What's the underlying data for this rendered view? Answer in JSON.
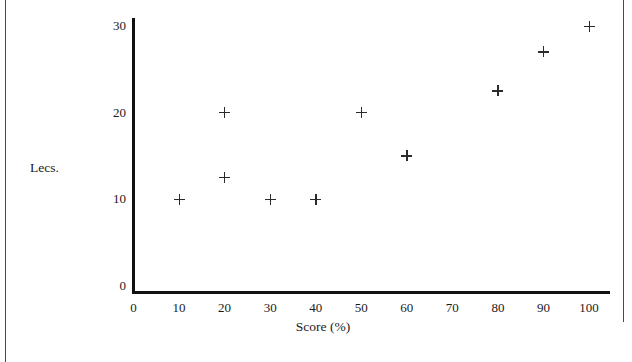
{
  "chart_data": {
    "type": "scatter",
    "title": "",
    "xlabel": "Score (%)",
    "ylabel": "Lecs.",
    "xlim": [
      0,
      100
    ],
    "ylim": [
      0,
      30
    ],
    "grid": false,
    "legend": false,
    "marker": "plus",
    "marker_color": "#2b2b2b",
    "xticks": [
      0,
      10,
      20,
      30,
      40,
      50,
      60,
      70,
      80,
      90,
      100
    ],
    "xtick_labels": [
      "0",
      "10",
      "20",
      "30",
      "40",
      "50",
      "60",
      "70",
      "80",
      "90",
      "100"
    ],
    "yticks": [
      0,
      10,
      20,
      30
    ],
    "ytick_labels": [
      "0",
      "10",
      "20",
      "30"
    ],
    "points": [
      {
        "x": 10,
        "y": 10
      },
      {
        "x": 20,
        "y": 20
      },
      {
        "x": 20,
        "y": 12.5
      },
      {
        "x": 30,
        "y": 10
      },
      {
        "x": 40,
        "y": 10
      },
      {
        "x": 50,
        "y": 20
      },
      {
        "x": 60,
        "y": 15
      },
      {
        "x": 80,
        "y": 22.5
      },
      {
        "x": 90,
        "y": 27
      },
      {
        "x": 100,
        "y": 30
      }
    ]
  }
}
